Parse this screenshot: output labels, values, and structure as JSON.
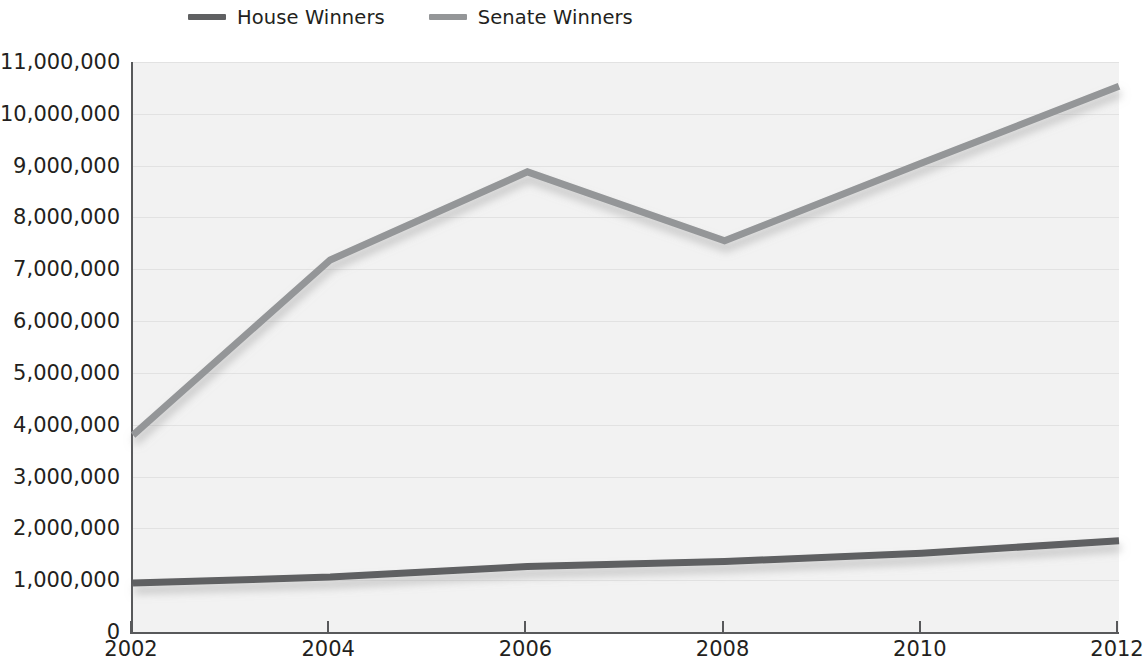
{
  "legend": {
    "position": "top-left",
    "items": [
      {
        "label": "House Winners",
        "color": "#5f6062",
        "series_key": "house"
      },
      {
        "label": "Senate Winners",
        "color": "#949698",
        "series_key": "senate"
      }
    ]
  },
  "colors": {
    "plot_background": "#f2f2f2",
    "gridline": "#e2e2e2",
    "axis": "#58595b",
    "text": "#231f20",
    "house_line": "#5f6062",
    "senate_line": "#949698"
  },
  "chart_data": {
    "type": "line",
    "title": "",
    "subtitle": "",
    "xlabel": "",
    "ylabel": "",
    "x": [
      2002,
      2004,
      2006,
      2008,
      2010,
      2012
    ],
    "categories": [
      "2002",
      "2004",
      "2006",
      "2008",
      "2010",
      "2012"
    ],
    "xlim": [
      2002,
      2012
    ],
    "ylim": [
      0,
      11000000
    ],
    "ytick_step": 1000000,
    "ytick_labels": [
      "11,000,000",
      "10,000,000",
      "9,000,000",
      "8,000,000",
      "7,000,000",
      "6,000,000",
      "5,000,000",
      "4,000,000",
      "3,000,000",
      "2,000,000",
      "1,000,000",
      "0"
    ],
    "ytick_values": [
      11000000,
      10000000,
      9000000,
      8000000,
      7000000,
      6000000,
      5000000,
      4000000,
      3000000,
      2000000,
      1000000,
      0
    ],
    "xtick_labels": [
      "2002",
      "2004",
      "2006",
      "2008",
      "2010",
      "2012"
    ],
    "grid": true,
    "legend_position": "top-left",
    "series": [
      {
        "name": "House Winners",
        "key": "house",
        "color": "#5f6062",
        "values": [
          945000,
          1060000,
          1265000,
          1360000,
          1520000,
          1760000
        ]
      },
      {
        "name": "Senate Winners",
        "key": "senate",
        "color": "#949698",
        "values": [
          3800000,
          7180000,
          8880000,
          7550000,
          9050000,
          10530000
        ]
      }
    ]
  }
}
